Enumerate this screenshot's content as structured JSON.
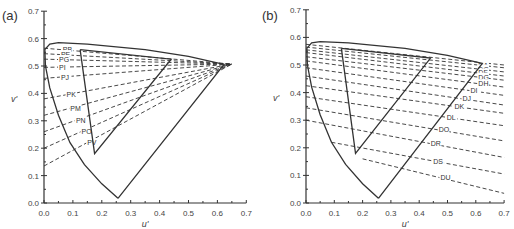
{
  "chart_data": [
    {
      "panel_label": "(a)",
      "type": "line",
      "xlabel": "u'",
      "ylabel": "v'",
      "xlim": [
        0.0,
        0.7
      ],
      "ylim": [
        0.0,
        0.7
      ],
      "xticks": [
        "0.0",
        "0.1",
        "0.2",
        "0.3",
        "0.4",
        "0.5",
        "0.6",
        "0.7"
      ],
      "yticks": [
        "0.0",
        "0.1",
        "0.2",
        "0.3",
        "0.4",
        "0.5",
        "0.6",
        "0.7"
      ],
      "spectrum_locus": [
        [
          0.256,
          0.017
        ],
        [
          0.2,
          0.07
        ],
        [
          0.14,
          0.14
        ],
        [
          0.09,
          0.22
        ],
        [
          0.05,
          0.32
        ],
        [
          0.02,
          0.42
        ],
        [
          0.005,
          0.5
        ],
        [
          0.003,
          0.56
        ],
        [
          0.02,
          0.58
        ],
        [
          0.05,
          0.585
        ],
        [
          0.15,
          0.58
        ],
        [
          0.35,
          0.56
        ],
        [
          0.5,
          0.535
        ],
        [
          0.623,
          0.506
        ],
        [
          0.256,
          0.017
        ]
      ],
      "gamut_triangle": [
        [
          0.125,
          0.56
        ],
        [
          0.175,
          0.18
        ],
        [
          0.44,
          0.525
        ],
        [
          0.125,
          0.56
        ]
      ],
      "convergence_point": [
        0.65,
        0.507
      ],
      "series": [
        {
          "name": "PB",
          "start": [
            0.0,
            0.565
          ]
        },
        {
          "name": "PE",
          "start": [
            0.0,
            0.545
          ]
        },
        {
          "name": "PG",
          "start": [
            0.0,
            0.525
          ]
        },
        {
          "name": "PI",
          "start": [
            0.0,
            0.495
          ]
        },
        {
          "name": "PJ",
          "start": [
            0.0,
            0.455
          ]
        },
        {
          "name": "PK",
          "start": [
            0.0,
            0.38
          ]
        },
        {
          "name": "PM",
          "start": [
            0.0,
            0.32
          ]
        },
        {
          "name": "PN",
          "start": [
            0.0,
            0.26
          ]
        },
        {
          "name": "PO",
          "start": [
            0.0,
            0.2
          ]
        },
        {
          "name": "PV",
          "start": [
            0.0,
            0.135
          ]
        }
      ],
      "legend": "none; dashed lines labeled inline"
    },
    {
      "panel_label": "(b)",
      "type": "line",
      "xlabel": "u'",
      "ylabel": "v'",
      "xlim": [
        0.0,
        0.7
      ],
      "ylim": [
        0.0,
        0.7
      ],
      "xticks": [
        "0.0",
        "0.1",
        "0.2",
        "0.3",
        "0.4",
        "0.5",
        "0.6",
        "0.7"
      ],
      "yticks": [
        "0.0",
        "0.1",
        "0.2",
        "0.3",
        "0.4",
        "0.5",
        "0.6",
        "0.7"
      ],
      "spectrum_locus": [
        [
          0.256,
          0.017
        ],
        [
          0.2,
          0.07
        ],
        [
          0.14,
          0.14
        ],
        [
          0.09,
          0.22
        ],
        [
          0.05,
          0.32
        ],
        [
          0.02,
          0.42
        ],
        [
          0.005,
          0.5
        ],
        [
          0.003,
          0.56
        ],
        [
          0.02,
          0.58
        ],
        [
          0.05,
          0.585
        ],
        [
          0.15,
          0.58
        ],
        [
          0.35,
          0.56
        ],
        [
          0.5,
          0.535
        ],
        [
          0.623,
          0.506
        ],
        [
          0.256,
          0.017
        ]
      ],
      "gamut_triangle": [
        [
          0.125,
          0.56
        ],
        [
          0.175,
          0.18
        ],
        [
          0.44,
          0.525
        ],
        [
          0.125,
          0.56
        ]
      ],
      "series": [
        {
          "name": "",
          "start": [
            0.0,
            0.575
          ],
          "end": [
            0.7,
            0.5
          ]
        },
        {
          "name": "DA",
          "start": [
            0.0,
            0.565
          ],
          "end": [
            0.7,
            0.49
          ]
        },
        {
          "name": "DC",
          "start": [
            0.0,
            0.555
          ],
          "end": [
            0.7,
            0.475
          ]
        },
        {
          "name": "DF",
          "start": [
            0.0,
            0.545
          ],
          "end": [
            0.7,
            0.46
          ]
        },
        {
          "name": "DG",
          "start": [
            0.0,
            0.53
          ],
          "end": [
            0.7,
            0.445
          ]
        },
        {
          "name": "DH",
          "start": [
            0.0,
            0.515
          ],
          "end": [
            0.7,
            0.42
          ]
        },
        {
          "name": "DI",
          "start": [
            0.0,
            0.49
          ],
          "end": [
            0.7,
            0.39
          ]
        },
        {
          "name": "DJ",
          "start": [
            0.0,
            0.46
          ],
          "end": [
            0.7,
            0.355
          ]
        },
        {
          "name": "DK",
          "start": [
            0.0,
            0.425
          ],
          "end": [
            0.7,
            0.325
          ]
        },
        {
          "name": "DL",
          "start": [
            0.0,
            0.385
          ],
          "end": [
            0.7,
            0.28
          ]
        },
        {
          "name": "DO",
          "start": [
            0.0,
            0.345
          ],
          "end": [
            0.7,
            0.225
          ]
        },
        {
          "name": "DR",
          "start": [
            0.0,
            0.3
          ],
          "end": [
            0.7,
            0.165
          ]
        },
        {
          "name": "DS",
          "start": [
            0.09,
            0.22
          ],
          "end": [
            0.7,
            0.105
          ]
        },
        {
          "name": "DU",
          "start": [
            0.2,
            0.16
          ],
          "end": [
            0.7,
            0.035
          ]
        }
      ],
      "legend": "none; dashed lines labeled inline"
    }
  ]
}
